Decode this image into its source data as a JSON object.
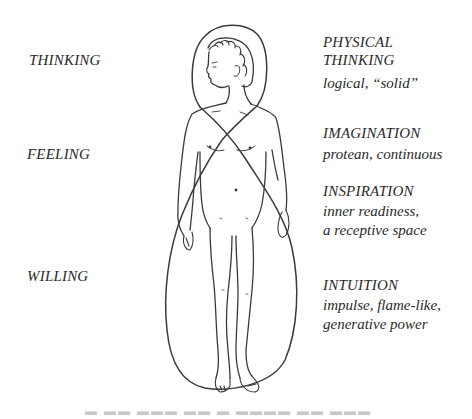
{
  "left_labels": {
    "thinking": "THINKING",
    "feeling": "FEELING",
    "willing": "WILLING"
  },
  "right_labels": {
    "physical_thinking": {
      "title_line1": "PHYSICAL",
      "title_line2": "THINKING",
      "description": "logical, “solid”"
    },
    "imagination": {
      "title": "IMAGINATION",
      "description": "protean, continuous"
    },
    "inspiration": {
      "title": "INSPIRATION",
      "description_line1": "inner readiness,",
      "description_line2": "a receptive space"
    },
    "intuition": {
      "title": "INTUITION",
      "description_line1": "impulse, flame-like,",
      "description_line2": "generative power"
    }
  },
  "figure": {
    "line_color": "#3a3a3a"
  }
}
